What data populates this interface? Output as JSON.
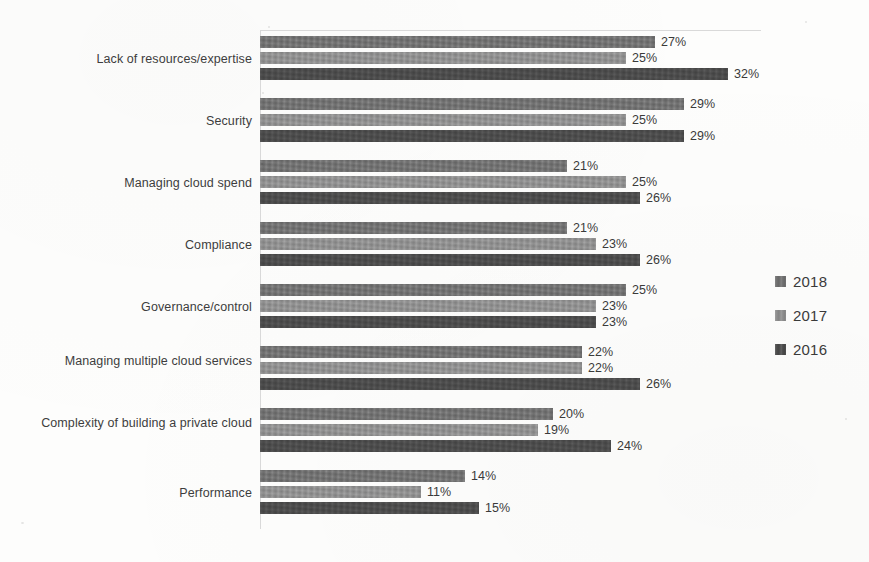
{
  "chart_data": {
    "type": "bar",
    "orientation": "horizontal",
    "title": "",
    "subtitle": "",
    "xlabel": "",
    "ylabel": "",
    "grid": false,
    "legend_position": "right",
    "value_suffix": "%",
    "xlim": [
      0,
      32
    ],
    "categories": [
      "Lack of resources/expertise",
      "Security",
      "Managing cloud spend",
      "Compliance",
      "Governance/control",
      "Managing multiple cloud services",
      "Complexity of building a private cloud",
      "Performance"
    ],
    "series": [
      {
        "name": "2018",
        "color": "#6f6f6f",
        "values": [
          27,
          29,
          21,
          21,
          25,
          22,
          20,
          14
        ],
        "labels": [
          "27%",
          "29%",
          "21%",
          "21%",
          "25%",
          "22%",
          "20%",
          "14%"
        ]
      },
      {
        "name": "2017",
        "color": "#8d8d8d",
        "values": [
          25,
          25,
          25,
          23,
          23,
          22,
          19,
          11
        ],
        "labels": [
          "25%",
          "25%",
          "25%",
          "23%",
          "23%",
          "22%",
          "19%",
          "11%"
        ]
      },
      {
        "name": "2016",
        "color": "#4a4a4a",
        "values": [
          32,
          29,
          26,
          26,
          23,
          26,
          24,
          15
        ],
        "labels": [
          "32%",
          "29%",
          "26%",
          "26%",
          "23%",
          "26%",
          "24%",
          "15%"
        ]
      }
    ],
    "legend": [
      {
        "label": "2018",
        "color": "#6f6f6f"
      },
      {
        "label": "2017",
        "color": "#8d8d8d"
      },
      {
        "label": "2016",
        "color": "#4a4a4a"
      }
    ]
  }
}
